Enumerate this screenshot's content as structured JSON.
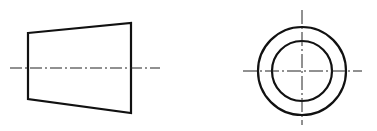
{
  "diagram": {
    "type": "orthographic-projection",
    "stroke_color": "#111111",
    "background": "#ffffff",
    "views": [
      {
        "name": "front-view",
        "shape": "frustum-trapezoid",
        "corners": [
          [
            28,
            33
          ],
          [
            131,
            23
          ],
          [
            131,
            113
          ],
          [
            28,
            99
          ]
        ],
        "centerline": {
          "x1": 10,
          "y1": 68,
          "x2": 160,
          "y2": 68
        }
      },
      {
        "name": "side-view",
        "shape": "concentric-circles",
        "center": [
          302,
          71
        ],
        "outer_radius": 44,
        "inner_radius": 30,
        "vertical_axis": {
          "y1": 10,
          "y2": 125
        },
        "horizontal_axis": {
          "x1": 243,
          "x2": 362
        }
      }
    ]
  }
}
